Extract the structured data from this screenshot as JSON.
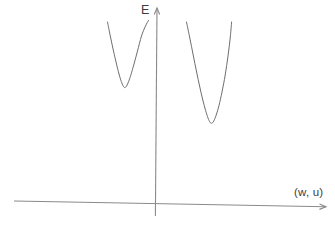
{
  "figure": {
    "background_color": "#ffffff",
    "axis_color": "#8a8a8a",
    "curve_color": "#6e6e6e",
    "label_color": "#3d3d3d"
  },
  "chart_data": {
    "type": "line",
    "title": "",
    "xlabel": "(w, u)",
    "ylabel": "E",
    "axis_ticks": "none",
    "grid": false,
    "legend": "none",
    "axes_px": [
      {
        "name": "y-axis",
        "tail": [
          155.4,
          216
        ],
        "tip": [
          157,
          8
        ]
      },
      {
        "name": "x-axis",
        "tail": [
          14,
          201
        ],
        "tip": [
          326,
          206.8
        ]
      }
    ],
    "series": [
      {
        "name": "left-well",
        "points_px": [
          [
            107.5,
            22
          ],
          [
            110.5,
            37
          ],
          [
            113.5,
            51
          ],
          [
            116.5,
            64
          ],
          [
            119,
            74
          ],
          [
            121.3,
            81.5
          ],
          [
            123.2,
            86
          ],
          [
            124.8,
            87.6
          ],
          [
            126.6,
            86
          ],
          [
            128.6,
            81.5
          ],
          [
            131,
            74.5
          ],
          [
            134,
            64
          ],
          [
            137.5,
            51
          ],
          [
            141.5,
            36
          ],
          [
            145.5,
            26
          ],
          [
            148.5,
            20.5
          ]
        ]
      },
      {
        "name": "right-well",
        "points_px": [
          [
            186.5,
            22
          ],
          [
            189.8,
            38
          ],
          [
            193.2,
            55
          ],
          [
            196.6,
            72
          ],
          [
            199.8,
            87
          ],
          [
            202.8,
            100
          ],
          [
            205.6,
            110.5
          ],
          [
            208,
            118
          ],
          [
            210,
            122.3
          ],
          [
            211.8,
            123.2
          ],
          [
            213.8,
            121
          ],
          [
            216.2,
            115
          ],
          [
            219,
            105.5
          ],
          [
            222,
            92
          ],
          [
            225.2,
            75
          ],
          [
            228,
            56
          ],
          [
            230.2,
            38
          ],
          [
            231.6,
            22
          ]
        ]
      }
    ]
  }
}
